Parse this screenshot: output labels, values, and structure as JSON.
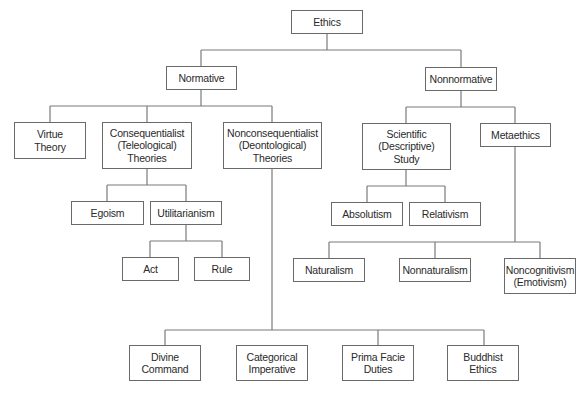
{
  "diagram": {
    "title": "Ethics",
    "nodes": {
      "ethics": "Ethics",
      "normative": "Normative",
      "nonnormative": "Nonnormative",
      "virtue": "Virtue\nTheory",
      "consequentialist": "Consequentialist\n(Teleological)\nTheories",
      "nonconsequentialist": "Nonconsequentialist\n(Deontological)\nTheories",
      "scientific": "Scientific\n(Descriptive)\nStudy",
      "metaethics": "Metaethics",
      "egoism": "Egoism",
      "utilitarianism": "Utilitarianism",
      "act": "Act",
      "rule": "Rule",
      "absolutism": "Absolutism",
      "relativism": "Relativism",
      "naturalism": "Naturalism",
      "nonnaturalism": "Nonnaturalism",
      "noncognitivism": "Noncognitivism\n(Emotivism)",
      "divine_command": "Divine\nCommand",
      "categorical_imperative": "Categorical\nImperative",
      "prima_facie": "Prima Facie\nDuties",
      "buddhist_ethics": "Buddhist\nEthics"
    },
    "edges": [
      [
        "Ethics",
        "Normative"
      ],
      [
        "Ethics",
        "Nonnormative"
      ],
      [
        "Normative",
        "Virtue Theory"
      ],
      [
        "Normative",
        "Consequentialist (Teleological) Theories"
      ],
      [
        "Normative",
        "Nonconsequentialist (Deontological) Theories"
      ],
      [
        "Consequentialist (Teleological) Theories",
        "Egoism"
      ],
      [
        "Consequentialist (Teleological) Theories",
        "Utilitarianism"
      ],
      [
        "Utilitarianism",
        "Act"
      ],
      [
        "Utilitarianism",
        "Rule"
      ],
      [
        "Nonconsequentialist (Deontological) Theories",
        "Divine Command"
      ],
      [
        "Nonconsequentialist (Deontological) Theories",
        "Categorical Imperative"
      ],
      [
        "Nonconsequentialist (Deontological) Theories",
        "Prima Facie Duties"
      ],
      [
        "Nonconsequentialist (Deontological) Theories",
        "Buddhist Ethics"
      ],
      [
        "Nonnormative",
        "Scientific (Descriptive) Study"
      ],
      [
        "Nonnormative",
        "Metaethics"
      ],
      [
        "Scientific (Descriptive) Study",
        "Absolutism"
      ],
      [
        "Scientific (Descriptive) Study",
        "Relativism"
      ],
      [
        "Metaethics",
        "Naturalism"
      ],
      [
        "Metaethics",
        "Nonnaturalism"
      ],
      [
        "Metaethics",
        "Noncognitivism (Emotivism)"
      ]
    ]
  }
}
